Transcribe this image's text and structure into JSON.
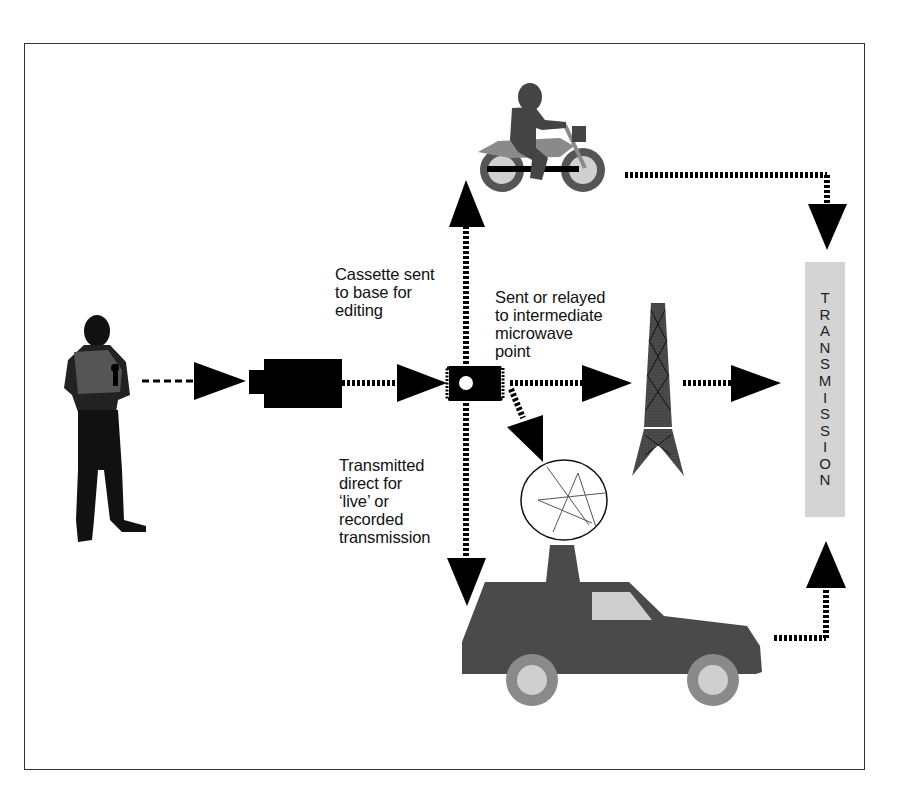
{
  "diagram": {
    "labels": {
      "cassette": "Cassette sent\nto base for\nediting",
      "microwave": "Sent or relayed\nto intermediate\nmicrowave\npoint",
      "direct": "Transmitted\ndirect for\n‘live’ or\nrecorded\ntransmission"
    },
    "transmission_letters": [
      "T",
      "R",
      "A",
      "N",
      "S",
      "M",
      "I",
      "S",
      "S",
      "I",
      "O",
      "N"
    ],
    "nodes": [
      {
        "id": "reporter",
        "icon": "reporter-icon"
      },
      {
        "id": "camera",
        "icon": "video-camera-icon"
      },
      {
        "id": "chip",
        "icon": "signal-hub-icon"
      },
      {
        "id": "motorcycle",
        "icon": "motorcycle-courier-icon"
      },
      {
        "id": "tower",
        "icon": "microwave-tower-icon"
      },
      {
        "id": "ob-van",
        "icon": "satellite-van-icon"
      },
      {
        "id": "transmission",
        "icon": "transmission-bar"
      }
    ],
    "colors": {
      "ink": "#000000",
      "dark_grey": "#4a4a4a",
      "mid_grey": "#8a8a8a",
      "light_grey": "#cfcfcf",
      "bar_grey": "#d4d4d4"
    }
  }
}
